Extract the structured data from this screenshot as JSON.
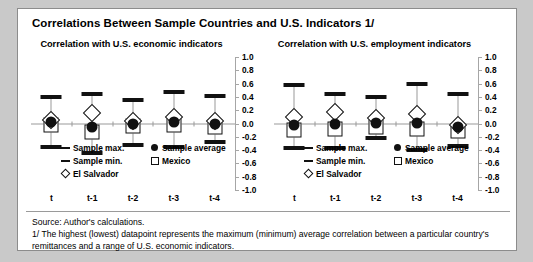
{
  "figure": {
    "title": "Correlations Between Sample Countries and U.S. Indicators 1/",
    "source_line": "Source: Author's calculations.",
    "footnote_line": "1/ The highest (lowest) datapoint represents the maximum (minimum) average correlation between a particular country's remittances and a range of U.S. economic indicators."
  },
  "legend": {
    "sample_max": "Sample max.",
    "sample_min": "Sample min.",
    "el_salvador": "El Salvador",
    "sample_average": "Sample average",
    "mexico": "Mexico"
  },
  "axis": {
    "yticks": [
      "1.0",
      "0.8",
      "0.6",
      "0.4",
      "0.2",
      "0.0",
      "-0.2",
      "-0.4",
      "-0.6",
      "-0.8",
      "-1.0"
    ],
    "ytick_values": [
      1.0,
      0.8,
      0.6,
      0.4,
      0.2,
      0.0,
      -0.2,
      -0.4,
      -0.6,
      -0.8,
      -1.0
    ],
    "ylim": [
      -1.0,
      1.0
    ],
    "categories": [
      "t",
      "t-1",
      "t-2",
      "t-3",
      "t-4"
    ]
  },
  "chart_data": [
    {
      "type": "scatter",
      "id": "economic",
      "title": "Correlation with U.S. economic indicators",
      "xlabel": "",
      "ylabel": "",
      "ylim": [
        -1.0,
        1.0
      ],
      "grid": false,
      "legend_position": "inside-bottom",
      "categories": [
        "t",
        "t-1",
        "t-2",
        "t-3",
        "t-4"
      ],
      "series": [
        {
          "name": "Sample max.",
          "marker": "dash",
          "values": [
            0.4,
            0.44,
            0.36,
            0.47,
            0.42
          ]
        },
        {
          "name": "Sample min.",
          "marker": "dash",
          "values": [
            -0.36,
            -0.44,
            -0.32,
            -0.36,
            -0.28
          ]
        },
        {
          "name": "Sample average",
          "marker": "circle",
          "values": [
            0.03,
            -0.06,
            0.0,
            0.03,
            0.0
          ]
        },
        {
          "name": "Mexico",
          "marker": "square",
          "values": [
            -0.03,
            -0.13,
            -0.04,
            -0.03,
            -0.06
          ]
        },
        {
          "name": "El Salvador",
          "marker": "diamond",
          "values": [
            0.05,
            0.16,
            0.04,
            0.1,
            0.04
          ]
        }
      ]
    },
    {
      "type": "scatter",
      "id": "employment",
      "title": "Correlation with U.S. employment indicators",
      "xlabel": "",
      "ylabel": "",
      "ylim": [
        -1.0,
        1.0
      ],
      "grid": false,
      "legend_position": "inside-bottom",
      "categories": [
        "t",
        "t-1",
        "t-2",
        "t-3",
        "t-4"
      ],
      "series": [
        {
          "name": "Sample max.",
          "marker": "dash",
          "values": [
            0.58,
            0.45,
            0.4,
            0.6,
            0.44
          ]
        },
        {
          "name": "Sample min.",
          "marker": "dash",
          "values": [
            -0.37,
            -0.37,
            -0.22,
            -0.4,
            -0.34
          ]
        },
        {
          "name": "Sample average",
          "marker": "circle",
          "values": [
            -0.02,
            0.0,
            0.01,
            0.01,
            -0.05
          ]
        },
        {
          "name": "Mexico",
          "marker": "square",
          "values": [
            -0.1,
            -0.08,
            -0.05,
            -0.09,
            -0.11
          ]
        },
        {
          "name": "El Salvador",
          "marker": "diamond",
          "values": [
            0.1,
            0.17,
            0.08,
            0.14,
            -0.02
          ]
        }
      ]
    }
  ]
}
